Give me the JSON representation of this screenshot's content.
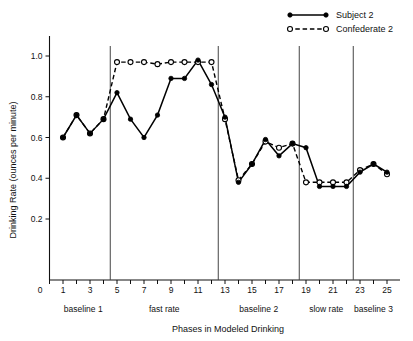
{
  "chart_data": {
    "type": "line",
    "title": "",
    "xlabel": "Phases in Modeled Drinking",
    "ylabel": "Drinking Rate (ounces per minute)",
    "x": [
      1,
      2,
      3,
      4,
      5,
      6,
      7,
      8,
      9,
      10,
      11,
      12,
      13,
      14,
      15,
      16,
      17,
      18,
      19,
      20,
      21,
      22,
      23,
      24,
      25
    ],
    "xlim": [
      0,
      26
    ],
    "ylim": [
      0,
      1.08
    ],
    "yticks": [
      0.2,
      0.4,
      0.6,
      0.8,
      1.0
    ],
    "ytick_labels": [
      "0.2",
      "0.4",
      "0.6",
      "0.8",
      "1.0"
    ],
    "y_origin_label": "0",
    "xticks": [
      1,
      2,
      3,
      4,
      5,
      6,
      7,
      8,
      9,
      10,
      11,
      12,
      13,
      14,
      15,
      16,
      17,
      18,
      19,
      20,
      21,
      22,
      23,
      24,
      25
    ],
    "xtick_labels_shown": [
      "1",
      "3",
      "5",
      "7",
      "9",
      "11",
      "13",
      "15",
      "17",
      "19",
      "21",
      "23",
      "25"
    ],
    "x_origin_label": "0",
    "grid": false,
    "legend_position": "top-right",
    "series": [
      {
        "name": "Subject 2",
        "style": "solid",
        "marker": "filled-circle",
        "values": [
          0.6,
          0.71,
          0.62,
          0.69,
          0.82,
          0.69,
          0.6,
          0.71,
          0.89,
          0.89,
          0.98,
          0.86,
          0.7,
          0.38,
          0.47,
          0.59,
          0.51,
          0.57,
          0.55,
          0.36,
          0.36,
          0.36,
          0.43,
          0.47,
          0.43
        ]
      },
      {
        "name": "Confederate 2",
        "style": "dashed",
        "marker": "open-circle",
        "values": [
          0.6,
          0.71,
          0.62,
          0.69,
          0.97,
          0.97,
          0.97,
          0.96,
          0.97,
          0.97,
          0.97,
          0.97,
          0.69,
          0.39,
          0.47,
          0.58,
          0.55,
          0.57,
          0.38,
          0.38,
          0.38,
          0.38,
          0.44,
          0.47,
          0.42
        ]
      }
    ],
    "phases": [
      {
        "label": "baseline 1",
        "start": 1,
        "end": 4
      },
      {
        "label": "fast rate",
        "start": 5,
        "end": 12
      },
      {
        "label": "baseline 2",
        "start": 13,
        "end": 18
      },
      {
        "label": "slow rate",
        "start": 19,
        "end": 22
      },
      {
        "label": "baseline 3",
        "start": 23,
        "end": 25
      }
    ],
    "phase_dividers": [
      4.5,
      12.5,
      18.5,
      22.5
    ],
    "annotations": []
  },
  "legend": {
    "entries": [
      {
        "label": "Subject 2"
      },
      {
        "label": "Confederate 2"
      }
    ]
  },
  "colors": {
    "ink": "#000000",
    "axis": "#111111",
    "divider": "#444444",
    "background": "#ffffff"
  }
}
